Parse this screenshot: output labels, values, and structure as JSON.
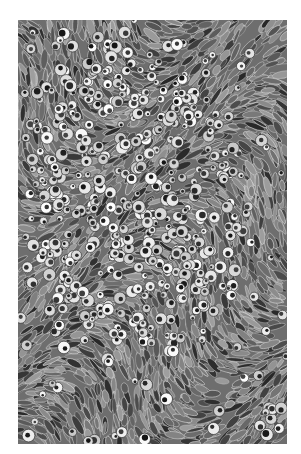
{
  "image": {
    "kind": "grayscale histology micrograph",
    "description": "Densely packed cells; central region with round pale cells with dark nuclei, periphery with elongated spindle-shaped darker cells",
    "background": "#ffffff",
    "frame": {
      "x": 18,
      "y": 20,
      "width": 269,
      "height": 424
    },
    "palette": {
      "dark": "#1e1e1e",
      "mid": "#7a7a7a",
      "light": "#f4f4f4",
      "base": "#6e6e6e"
    },
    "regions": {
      "round_cell_zone_center": [
        0.42,
        0.42
      ],
      "round_cell_zone_radius": [
        0.42,
        0.38
      ]
    },
    "seed": 7
  }
}
